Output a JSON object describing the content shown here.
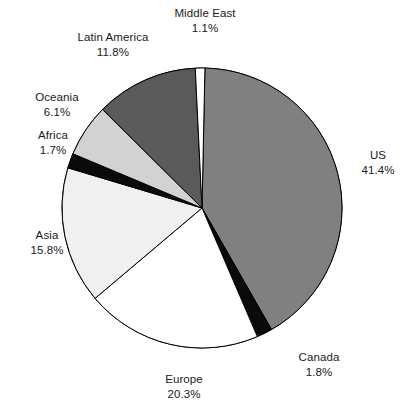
{
  "chart_data": {
    "type": "pie",
    "title": "",
    "subtitle": "",
    "xlabel": "",
    "ylabel": "",
    "legend_position": "none",
    "grid": false,
    "labels_outside": true,
    "value_suffix": "%",
    "categories": [
      "US",
      "Canada",
      "Europe",
      "Asia",
      "Africa",
      "Oceania",
      "Latin America",
      "Middle East"
    ],
    "values": [
      41.4,
      1.8,
      20.3,
      15.8,
      1.7,
      6.1,
      11.8,
      1.1
    ],
    "total": 100.0,
    "slice_colors": [
      "#808080",
      "#0a0a0a",
      "#ffffff",
      "#f0f0f0",
      "#0a0a0a",
      "#d2d2d2",
      "#5a5a5a",
      "#ffffff"
    ],
    "stroke_color": "#000000",
    "start_angle_deg": 1.2,
    "direction": "clockwise",
    "center": {
      "x": 202,
      "y": 208
    },
    "radius": 140,
    "slices": [
      {
        "name": "US",
        "value": 41.4,
        "value_label": "41.4%",
        "color": "#808080"
      },
      {
        "name": "Canada",
        "value": 1.8,
        "value_label": "1.8%",
        "color": "#0a0a0a"
      },
      {
        "name": "Europe",
        "value": 20.3,
        "value_label": "20.3%",
        "color": "#ffffff"
      },
      {
        "name": "Asia",
        "value": 15.8,
        "value_label": "15.8%",
        "color": "#f0f0f0"
      },
      {
        "name": "Africa",
        "value": 1.7,
        "value_label": "1.7%",
        "color": "#0a0a0a"
      },
      {
        "name": "Oceania",
        "value": 6.1,
        "value_label": "6.1%",
        "color": "#d2d2d2"
      },
      {
        "name": "Latin America",
        "value": 11.8,
        "value_label": "11.8%",
        "color": "#5a5a5a"
      },
      {
        "name": "Middle East",
        "value": 1.1,
        "value_label": "1.1%",
        "color": "#ffffff"
      }
    ]
  },
  "labels": {
    "us": {
      "name": "US",
      "value": "41.4%"
    },
    "canada": {
      "name": "Canada",
      "value": "1.8%"
    },
    "europe": {
      "name": "Europe",
      "value": "20.3%"
    },
    "asia": {
      "name": "Asia",
      "value": "15.8%"
    },
    "africa": {
      "name": "Africa",
      "value": "1.7%"
    },
    "oceania": {
      "name": "Oceania",
      "value": "6.1%"
    },
    "latin_america": {
      "name": "Latin America",
      "value": "11.8%"
    },
    "middle_east": {
      "name": "Middle East",
      "value": "1.1%"
    }
  }
}
